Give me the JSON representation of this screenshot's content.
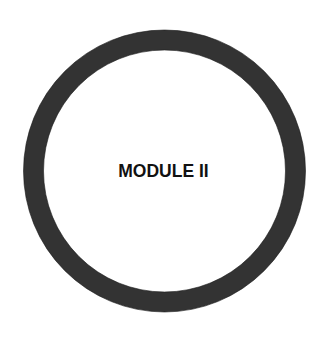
{
  "diagram": {
    "label": "MODULE II",
    "ring": {
      "shape": "circle",
      "stroke_color": "#333333",
      "fill_color": "#ffffff"
    },
    "background_color": "#ffffff"
  }
}
